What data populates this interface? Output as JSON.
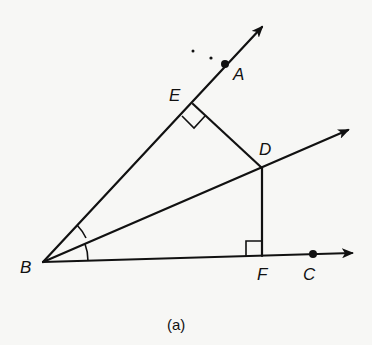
{
  "figure": {
    "caption": "(a)",
    "labels": {
      "A": "A",
      "B": "B",
      "C": "C",
      "D": "D",
      "E": "E",
      "F": "F"
    },
    "points": {
      "B": [
        43,
        262
      ],
      "A": [
        225,
        64
      ],
      "E": [
        193,
        104
      ],
      "D": [
        262,
        168
      ],
      "F": [
        262,
        256
      ],
      "C": [
        313,
        254
      ]
    },
    "colors": {
      "ink": "#111111",
      "paper": "#f7f7f5"
    }
  }
}
